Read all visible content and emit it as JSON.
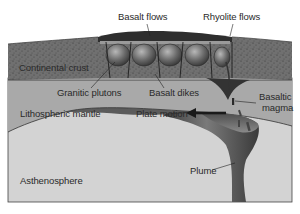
{
  "figure": {
    "labels": {
      "basalt_flows": "Basalt flows",
      "rhyolite_flows": "Rhyolite flows",
      "continental_crust": "Continental crust",
      "granitic_plutons": "Granitic plutons",
      "basalt_dikes": "Basalt dikes",
      "basaltic_magma_line1": "Basaltic",
      "basaltic_magma_line2": "magma",
      "lithospheric_mantle": "Lithospheric mantle",
      "plate_motion": "Plate motion",
      "plume": "Plume",
      "asthenosphere": "Asthenosphere"
    },
    "colors": {
      "crust": "#6e6e6e",
      "crust_speckle": "#3a3a3a",
      "lithospheric_mantle": "#a8a8a8",
      "asthenosphere": "#d4d4d4",
      "plume": "#5a5a5a",
      "basalt_top": "#2e2e2e",
      "text": "#2a2a2a"
    }
  }
}
